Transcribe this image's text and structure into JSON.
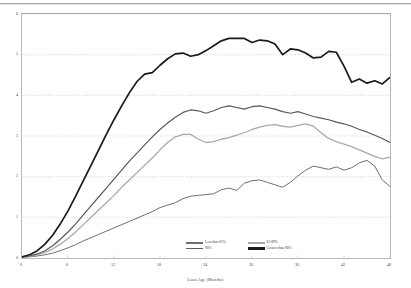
{
  "chart_data": {
    "type": "line",
    "title": "",
    "xlabel": "Loan Age (Months)",
    "ylabel": "CPR (%)",
    "xlim": [
      0,
      48
    ],
    "ylim": [
      0,
      6
    ],
    "grid": "horizontal-dotted",
    "legend_position": "bottom-center",
    "xticks": [
      "0",
      "6",
      "12",
      "18",
      "24",
      "30",
      "36",
      "42",
      "48"
    ],
    "yticks": [
      "0",
      "1",
      "2",
      "3",
      "4",
      "5",
      "6"
    ],
    "x": [
      0,
      1,
      2,
      3,
      4,
      5,
      6,
      7,
      8,
      9,
      10,
      11,
      12,
      13,
      14,
      15,
      16,
      17,
      18,
      19,
      20,
      21,
      22,
      23,
      24,
      25,
      26,
      27,
      28,
      29,
      30,
      31,
      32,
      33,
      34,
      35,
      36,
      37,
      38,
      39,
      40,
      41,
      42,
      43,
      44,
      45,
      46,
      47,
      48
    ],
    "series": [
      {
        "name": "Less than 81%",
        "color": "#6f6f6f",
        "width": 1.0,
        "values": [
          0.02,
          0.03,
          0.05,
          0.08,
          0.12,
          0.18,
          0.25,
          0.33,
          0.42,
          0.5,
          0.58,
          0.66,
          0.74,
          0.82,
          0.9,
          0.98,
          1.06,
          1.14,
          1.24,
          1.3,
          1.36,
          1.46,
          1.52,
          1.54,
          1.56,
          1.58,
          1.68,
          1.72,
          1.66,
          1.84,
          1.9,
          1.92,
          1.86,
          1.8,
          1.74,
          1.86,
          2.02,
          2.16,
          2.26,
          2.22,
          2.18,
          2.24,
          2.16,
          2.22,
          2.34,
          2.4,
          2.26,
          1.92,
          1.76
        ]
      },
      {
        "name": "81-89%",
        "color": "#a9a9a9",
        "width": 1.3,
        "values": [
          0.02,
          0.04,
          0.08,
          0.14,
          0.22,
          0.34,
          0.48,
          0.64,
          0.82,
          1.0,
          1.18,
          1.36,
          1.54,
          1.74,
          1.92,
          2.1,
          2.28,
          2.46,
          2.66,
          2.84,
          2.98,
          3.04,
          3.04,
          2.92,
          2.84,
          2.86,
          2.92,
          2.96,
          3.02,
          3.08,
          3.16,
          3.22,
          3.26,
          3.28,
          3.24,
          3.22,
          3.26,
          3.3,
          3.24,
          3.08,
          2.94,
          2.86,
          2.8,
          2.74,
          2.66,
          2.58,
          2.5,
          2.44,
          2.48
        ]
      },
      {
        "name": "90%",
        "color": "#5a5a5a",
        "width": 1.2,
        "values": [
          0.02,
          0.05,
          0.1,
          0.18,
          0.3,
          0.46,
          0.64,
          0.84,
          1.06,
          1.28,
          1.5,
          1.72,
          1.94,
          2.16,
          2.38,
          2.58,
          2.78,
          2.98,
          3.16,
          3.32,
          3.46,
          3.58,
          3.64,
          3.62,
          3.56,
          3.62,
          3.7,
          3.74,
          3.7,
          3.66,
          3.72,
          3.74,
          3.7,
          3.66,
          3.6,
          3.56,
          3.6,
          3.54,
          3.48,
          3.44,
          3.4,
          3.34,
          3.3,
          3.24,
          3.16,
          3.1,
          3.02,
          2.94,
          2.84
        ]
      },
      {
        "name": "Greater than 90%",
        "color": "#1a1a1a",
        "width": 1.7,
        "values": [
          0.03,
          0.08,
          0.18,
          0.34,
          0.56,
          0.84,
          1.16,
          1.52,
          1.9,
          2.28,
          2.66,
          3.04,
          3.4,
          3.74,
          4.06,
          4.34,
          4.52,
          4.56,
          4.74,
          4.9,
          5.02,
          5.04,
          4.96,
          5.0,
          5.1,
          5.22,
          5.34,
          5.4,
          5.4,
          5.4,
          5.3,
          5.36,
          5.34,
          5.26,
          5.0,
          5.14,
          5.12,
          5.04,
          4.92,
          4.94,
          5.08,
          5.06,
          4.72,
          4.32,
          4.4,
          4.3,
          4.36,
          4.28,
          4.44
        ]
      }
    ]
  },
  "legend": {
    "column_1": [
      {
        "label": "Less than 81%"
      },
      {
        "label": "90%"
      }
    ],
    "column_2": [
      {
        "label": "81-89%"
      },
      {
        "label": "Greater than 90%"
      }
    ]
  }
}
